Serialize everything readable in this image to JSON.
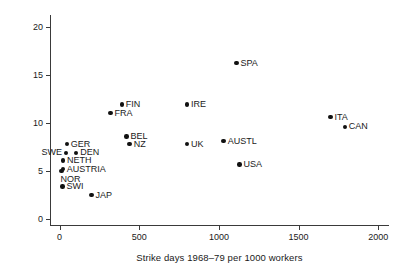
{
  "chart_data": {
    "type": "scatter",
    "title": "",
    "xlabel": "Strike days 1968–79 per 1000 workers",
    "ylabel": "Unemployment 1990 – 99 %",
    "xlim": [
      -60,
      2080
    ],
    "ylim": [
      -0.6,
      21.0
    ],
    "xticks": [
      0,
      500,
      1000,
      1500,
      2000
    ],
    "xticklabels": [
      "0",
      "500",
      "1000",
      "1500",
      "2000"
    ],
    "yticks": [
      0,
      5,
      10,
      15,
      20
    ],
    "yticklabels": [
      "0",
      "5",
      "10",
      "15",
      "20"
    ],
    "grid": false,
    "legend": null,
    "point_color": "#111111",
    "axis_color": "#3a3a3a",
    "points": [
      {
        "label": "SWI",
        "x": 18,
        "y": 3.4,
        "pos": "right"
      },
      {
        "label": "NOR",
        "x": 12,
        "y": 5.0,
        "pos": "below"
      },
      {
        "label": "AUSTRIA",
        "x": 20,
        "y": 5.2,
        "pos": "right"
      },
      {
        "label": "NETH",
        "x": 22,
        "y": 6.1,
        "pos": "right"
      },
      {
        "label": "SWE",
        "x": 40,
        "y": 6.9,
        "pos": "left"
      },
      {
        "label": "DEN",
        "x": 105,
        "y": 6.9,
        "pos": "right"
      },
      {
        "label": "GER",
        "x": 45,
        "y": 7.8,
        "pos": "right"
      },
      {
        "label": "JAP",
        "x": 200,
        "y": 2.5,
        "pos": "right"
      },
      {
        "label": "FRA",
        "x": 320,
        "y": 11.0,
        "pos": "right"
      },
      {
        "label": "FIN",
        "x": 390,
        "y": 11.9,
        "pos": "right"
      },
      {
        "label": "BEL",
        "x": 420,
        "y": 8.6,
        "pos": "right"
      },
      {
        "label": "NZ",
        "x": 440,
        "y": 7.8,
        "pos": "right"
      },
      {
        "label": "UK",
        "x": 800,
        "y": 7.8,
        "pos": "right"
      },
      {
        "label": "IRE",
        "x": 800,
        "y": 11.9,
        "pos": "right"
      },
      {
        "label": "AUSTL",
        "x": 1030,
        "y": 8.1,
        "pos": "right"
      },
      {
        "label": "SPA",
        "x": 1110,
        "y": 16.2,
        "pos": "right"
      },
      {
        "label": "USA",
        "x": 1130,
        "y": 5.7,
        "pos": "right"
      },
      {
        "label": "ITA",
        "x": 1700,
        "y": 10.6,
        "pos": "right"
      },
      {
        "label": "CAN",
        "x": 1790,
        "y": 9.6,
        "pos": "right"
      }
    ]
  }
}
